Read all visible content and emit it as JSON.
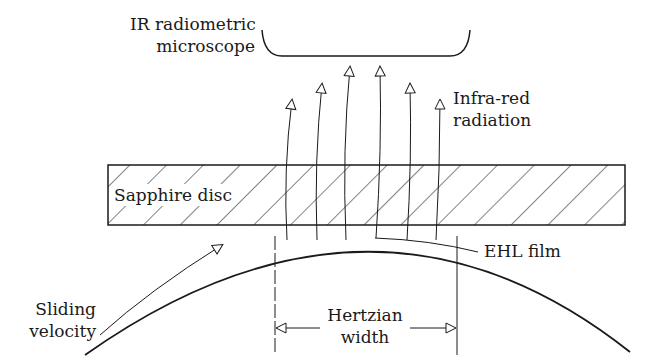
{
  "diagram": {
    "labels": {
      "microscope_line1": "IR radiometric",
      "microscope_line2": "microscope",
      "radiation_line1": "Infra-red",
      "radiation_line2": "radiation",
      "disc": "Sapphire disc",
      "ehl_film": "EHL film",
      "hertzian_line1": "Hertzian",
      "hertzian_line2": "width",
      "sliding_line1": "Sliding",
      "sliding_line2": "velocity"
    },
    "colors": {
      "stroke": "#1a1a1a",
      "background": "#ffffff"
    }
  }
}
